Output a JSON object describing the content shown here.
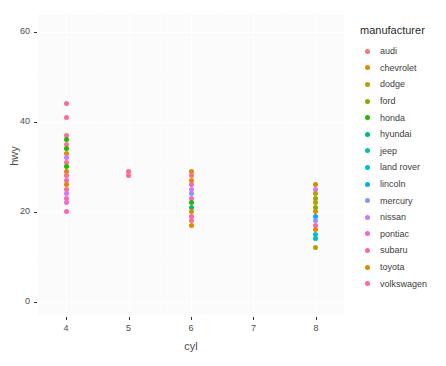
{
  "chart_data": {
    "type": "scatter",
    "title": "",
    "xlabel": "cyl",
    "ylabel": "hwy",
    "xlim": [
      3.55,
      8.45
    ],
    "ylim": [
      -3,
      64
    ],
    "grid": true,
    "legend_position": "right",
    "legend_title": "manufacturer",
    "x_ticks": [
      "4",
      "5",
      "6",
      "7",
      "8"
    ],
    "x_tick_values": [
      4,
      5,
      6,
      7,
      8
    ],
    "y_ticks": [
      "0",
      "20",
      "40",
      "60"
    ],
    "y_tick_values": [
      0,
      20,
      40,
      60
    ],
    "categories": [
      "audi",
      "chevrolet",
      "dodge",
      "ford",
      "honda",
      "hyundai",
      "jeep",
      "land rover",
      "lincoln",
      "mercury",
      "nissan",
      "pontiac",
      "subaru",
      "toyota",
      "volkswagen"
    ],
    "colors": {
      "audi": "#F8766D",
      "chevrolet": "#E18A00",
      "dodge": "#BE9C00",
      "ford": "#8CAB00",
      "honda": "#24B700",
      "hyundai": "#00BE70",
      "jeep": "#00C1AB",
      "land rover": "#00BBDA",
      "lincoln": "#00ACFC",
      "mercury": "#8B93FF",
      "nissan": "#D575FE",
      "pontiac": "#F962DD",
      "subaru": "#FF65AC",
      "toyota": "#E18A00",
      "volkswagen": "#FF6C90"
    },
    "points": [
      {
        "manufacturer": "volkswagen",
        "cyl": 4,
        "hwy": 44
      },
      {
        "manufacturer": "volkswagen",
        "cyl": 4,
        "hwy": 41
      },
      {
        "manufacturer": "volkswagen",
        "cyl": 4,
        "hwy": 37
      },
      {
        "manufacturer": "honda",
        "cyl": 4,
        "hwy": 36
      },
      {
        "manufacturer": "volkswagen",
        "cyl": 4,
        "hwy": 35
      },
      {
        "manufacturer": "honda",
        "cyl": 4,
        "hwy": 34
      },
      {
        "manufacturer": "toyota",
        "cyl": 4,
        "hwy": 33
      },
      {
        "manufacturer": "nissan",
        "cyl": 4,
        "hwy": 32
      },
      {
        "manufacturer": "volkswagen",
        "cyl": 4,
        "hwy": 31
      },
      {
        "manufacturer": "honda",
        "cyl": 4,
        "hwy": 30
      },
      {
        "manufacturer": "toyota",
        "cyl": 4,
        "hwy": 29
      },
      {
        "manufacturer": "volkswagen",
        "cyl": 4,
        "hwy": 28
      },
      {
        "manufacturer": "subaru",
        "cyl": 4,
        "hwy": 27
      },
      {
        "manufacturer": "toyota",
        "cyl": 4,
        "hwy": 26
      },
      {
        "manufacturer": "volkswagen",
        "cyl": 4,
        "hwy": 25
      },
      {
        "manufacturer": "nissan",
        "cyl": 4,
        "hwy": 24
      },
      {
        "manufacturer": "subaru",
        "cyl": 4,
        "hwy": 23
      },
      {
        "manufacturer": "pontiac",
        "cyl": 4,
        "hwy": 22
      },
      {
        "manufacturer": "subaru",
        "cyl": 4,
        "hwy": 20
      },
      {
        "manufacturer": "volkswagen",
        "cyl": 5,
        "hwy": 29
      },
      {
        "manufacturer": "volkswagen",
        "cyl": 5,
        "hwy": 28
      },
      {
        "manufacturer": "chevrolet",
        "cyl": 6,
        "hwy": 29
      },
      {
        "manufacturer": "volkswagen",
        "cyl": 6,
        "hwy": 28
      },
      {
        "manufacturer": "toyota",
        "cyl": 6,
        "hwy": 27
      },
      {
        "manufacturer": "subaru",
        "cyl": 6,
        "hwy": 26
      },
      {
        "manufacturer": "nissan",
        "cyl": 6,
        "hwy": 25
      },
      {
        "manufacturer": "mercury",
        "cyl": 6,
        "hwy": 24
      },
      {
        "manufacturer": "pontiac",
        "cyl": 6,
        "hwy": 23
      },
      {
        "manufacturer": "honda",
        "cyl": 6,
        "hwy": 22
      },
      {
        "manufacturer": "hyundai",
        "cyl": 6,
        "hwy": 21
      },
      {
        "manufacturer": "toyota",
        "cyl": 6,
        "hwy": 20
      },
      {
        "manufacturer": "subaru",
        "cyl": 6,
        "hwy": 19
      },
      {
        "manufacturer": "volkswagen",
        "cyl": 6,
        "hwy": 18
      },
      {
        "manufacturer": "toyota",
        "cyl": 6,
        "hwy": 17
      },
      {
        "manufacturer": "chevrolet",
        "cyl": 8,
        "hwy": 26
      },
      {
        "manufacturer": "nissan",
        "cyl": 8,
        "hwy": 25
      },
      {
        "manufacturer": "dodge",
        "cyl": 8,
        "hwy": 24
      },
      {
        "manufacturer": "ford",
        "cyl": 8,
        "hwy": 23
      },
      {
        "manufacturer": "dodge",
        "cyl": 8,
        "hwy": 22
      },
      {
        "manufacturer": "ford",
        "cyl": 8,
        "hwy": 21
      },
      {
        "manufacturer": "toyota",
        "cyl": 8,
        "hwy": 20
      },
      {
        "manufacturer": "lincoln",
        "cyl": 8,
        "hwy": 19
      },
      {
        "manufacturer": "mercury",
        "cyl": 8,
        "hwy": 18
      },
      {
        "manufacturer": "subaru",
        "cyl": 8,
        "hwy": 17
      },
      {
        "manufacturer": "toyota",
        "cyl": 8,
        "hwy": 16
      },
      {
        "manufacturer": "land rover",
        "cyl": 8,
        "hwy": 15
      },
      {
        "manufacturer": "jeep",
        "cyl": 8,
        "hwy": 14
      },
      {
        "manufacturer": "dodge",
        "cyl": 8,
        "hwy": 12
      }
    ]
  }
}
